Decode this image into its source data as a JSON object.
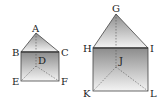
{
  "figures": [
    {
      "name": "prism-1",
      "labels": {
        "apex": "A",
        "top_left": "B",
        "top_right": "C",
        "inner": "D",
        "bottom_left": "E",
        "bottom_right": "F"
      }
    },
    {
      "name": "prism-2",
      "labels": {
        "apex": "G",
        "top_left": "H",
        "top_right": "I",
        "inner": "J",
        "bottom_left": "K",
        "bottom_right": "L"
      }
    }
  ],
  "colors": {
    "stroke": "#444444",
    "face_dark": "#8a8a8a",
    "face_light": "#f2f2f2"
  }
}
